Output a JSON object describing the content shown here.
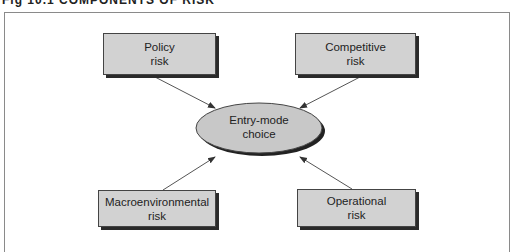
{
  "title": "Fig 10.1  COMPONENTS OF RISK",
  "diagram": {
    "center": {
      "label_line1": "Entry-mode",
      "label_line2": "choice"
    },
    "nodes": [
      {
        "id": "policy",
        "line1": "Policy",
        "line2": "risk"
      },
      {
        "id": "competitive",
        "line1": "Competitive",
        "line2": "risk"
      },
      {
        "id": "macro",
        "line1": "Macroenvironmental",
        "line2": "risk"
      },
      {
        "id": "operational",
        "line1": "Operational",
        "line2": "risk"
      }
    ],
    "edges": [
      {
        "from": "policy",
        "to": "center"
      },
      {
        "from": "competitive",
        "to": "center"
      },
      {
        "from": "macro",
        "to": "center"
      },
      {
        "from": "operational",
        "to": "center"
      }
    ],
    "colors": {
      "box_fill": "#d2d2d2",
      "ellipse_fill": "#c8c8c8",
      "shadow": "#2a2a2a",
      "line": "#555555"
    }
  }
}
